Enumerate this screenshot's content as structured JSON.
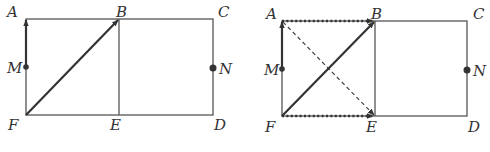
{
  "colors": {
    "edge": "#555555",
    "vector": "#333333",
    "point": "#333333",
    "label": "#333333",
    "background": "#ffffff"
  },
  "figures": [
    {
      "id": "left",
      "points": {
        "A": {
          "x": 26,
          "y": 19,
          "label": "A",
          "lx": 7,
          "ly": 17
        },
        "B": {
          "x": 119,
          "y": 19,
          "label": "B",
          "lx": 116,
          "ly": 17
        },
        "C": {
          "x": 213,
          "y": 19,
          "label": "C",
          "lx": 218,
          "ly": 17
        },
        "D": {
          "x": 213,
          "y": 115,
          "label": "D",
          "lx": 214,
          "ly": 130
        },
        "E": {
          "x": 119,
          "y": 115,
          "label": "E",
          "lx": 110,
          "ly": 130
        },
        "F": {
          "x": 26,
          "y": 115,
          "label": "F",
          "lx": 8,
          "ly": 130
        },
        "M": {
          "x": 26,
          "y": 67,
          "label": "M",
          "lx": 8,
          "ly": 73
        },
        "N": {
          "x": 213,
          "y": 68,
          "label": "N",
          "lx": 218,
          "ly": 74
        }
      },
      "vectors": [
        {
          "from": "M",
          "to": "A",
          "style": "solid",
          "name": "vector-MA"
        },
        {
          "from": "F",
          "to": "B",
          "style": "solid",
          "name": "vector-FB"
        }
      ]
    },
    {
      "id": "right",
      "points": {
        "A": {
          "x": 282,
          "y": 21,
          "label": "A",
          "lx": 266,
          "ly": 19
        },
        "B": {
          "x": 375,
          "y": 21,
          "label": "B",
          "lx": 371,
          "ly": 19
        },
        "C": {
          "x": 467,
          "y": 21,
          "label": "C",
          "lx": 473,
          "ly": 19
        },
        "D": {
          "x": 467,
          "y": 116,
          "label": "D",
          "lx": 468,
          "ly": 132
        },
        "E": {
          "x": 375,
          "y": 116,
          "label": "E",
          "lx": 366,
          "ly": 132
        },
        "F": {
          "x": 282,
          "y": 116,
          "label": "F",
          "lx": 265,
          "ly": 132
        },
        "M": {
          "x": 282,
          "y": 69,
          "label": "M",
          "lx": 264,
          "ly": 75
        },
        "N": {
          "x": 467,
          "y": 70,
          "label": "N",
          "lx": 472,
          "ly": 76
        }
      },
      "vectors": [
        {
          "from": "M",
          "to": "A",
          "style": "solid",
          "name": "vector-MA"
        },
        {
          "from": "F",
          "to": "B",
          "style": "solid",
          "name": "vector-FB"
        },
        {
          "from": "A",
          "to": "B",
          "style": "dotted",
          "name": "vector-AB"
        },
        {
          "from": "F",
          "to": "E",
          "style": "dotted",
          "name": "vector-FE"
        },
        {
          "from": "A",
          "to": "E",
          "style": "dashed",
          "name": "vector-AE"
        }
      ]
    }
  ]
}
